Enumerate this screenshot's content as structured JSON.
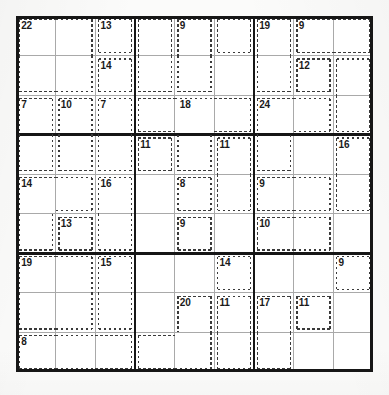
{
  "puzzle": {
    "type": "killer-sudoku",
    "grid_size": 9,
    "box_size": 3,
    "cell_px": 39.6,
    "grid_origin": {
      "x": 16,
      "y": 16
    },
    "colors": {
      "paper": "#fbfbfa",
      "grid_background": "#ffffff",
      "thick_line": "#161616",
      "thin_line": "#a9a9a9",
      "cage_dash": "#3a3a3a",
      "clue_text": "#1a1a1a"
    },
    "given_digits": [],
    "cages": [
      {
        "id": "cage-22",
        "sum": "22",
        "label_cell": [
          0,
          0
        ],
        "cells": [
          [
            0,
            0
          ],
          [
            0,
            1
          ],
          [
            1,
            0
          ],
          [
            1,
            1
          ]
        ]
      },
      {
        "id": "cage-13-top",
        "sum": "13",
        "label_cell": [
          0,
          2
        ],
        "cells": [
          [
            0,
            2
          ]
        ]
      },
      {
        "id": "cage-14-top",
        "sum": "14",
        "label_cell": [
          1,
          2
        ],
        "cells": [
          [
            1,
            2
          ]
        ]
      },
      {
        "id": "cage-9-c5",
        "sum": "9",
        "label_cell": [
          0,
          4
        ],
        "cells": [
          [
            0,
            4
          ],
          [
            1,
            4
          ]
        ]
      },
      {
        "id": "cage-9-r1c3-blank-left",
        "sum": "",
        "label_cell": [
          0,
          3
        ],
        "cells": [
          [
            0,
            3
          ],
          [
            1,
            3
          ]
        ]
      },
      {
        "id": "cage-topmid-right",
        "sum": "",
        "label_cell": [
          0,
          5
        ],
        "cells": [
          [
            0,
            5
          ]
        ]
      },
      {
        "id": "cage-19",
        "sum": "19",
        "label_cell": [
          0,
          6
        ],
        "cells": [
          [
            0,
            6
          ],
          [
            1,
            6
          ]
        ]
      },
      {
        "id": "cage-9-r1c8",
        "sum": "9",
        "label_cell": [
          0,
          7
        ],
        "cells": [
          [
            0,
            7
          ],
          [
            0,
            8
          ]
        ]
      },
      {
        "id": "cage-12",
        "sum": "12",
        "label_cell": [
          1,
          7
        ],
        "cells": [
          [
            1,
            7
          ]
        ]
      },
      {
        "id": "cage-r2c9",
        "sum": "",
        "label_cell": [
          1,
          8
        ],
        "cells": [
          [
            1,
            8
          ],
          [
            2,
            8
          ]
        ]
      },
      {
        "id": "cage-7-left",
        "sum": "7",
        "label_cell": [
          2,
          0
        ],
        "cells": [
          [
            2,
            0
          ],
          [
            3,
            0
          ]
        ]
      },
      {
        "id": "cage-10",
        "sum": "10",
        "label_cell": [
          2,
          1
        ],
        "cells": [
          [
            2,
            1
          ],
          [
            3,
            1
          ]
        ]
      },
      {
        "id": "cage-7-c3",
        "sum": "7",
        "label_cell": [
          2,
          2
        ],
        "cells": [
          [
            2,
            2
          ],
          [
            3,
            2
          ]
        ]
      },
      {
        "id": "cage-18",
        "sum": "18",
        "label_cell": [
          2,
          4
        ],
        "cells": [
          [
            2,
            3
          ],
          [
            2,
            4
          ],
          [
            2,
            5
          ],
          [
            3,
            4
          ]
        ]
      },
      {
        "id": "cage-24",
        "sum": "24",
        "label_cell": [
          2,
          6
        ],
        "cells": [
          [
            2,
            6
          ],
          [
            2,
            7
          ],
          [
            3,
            6
          ]
        ]
      },
      {
        "id": "cage-11-left",
        "sum": "11",
        "label_cell": [
          3,
          3
        ],
        "cells": [
          [
            3,
            3
          ]
        ]
      },
      {
        "id": "cage-11-right",
        "sum": "11",
        "label_cell": [
          3,
          5
        ],
        "cells": [
          [
            3,
            5
          ],
          [
            4,
            5
          ]
        ]
      },
      {
        "id": "cage-16-right",
        "sum": "16",
        "label_cell": [
          3,
          8
        ],
        "cells": [
          [
            3,
            8
          ],
          [
            4,
            8
          ]
        ]
      },
      {
        "id": "cage-14-mid",
        "sum": "14",
        "label_cell": [
          4,
          0
        ],
        "cells": [
          [
            4,
            0
          ],
          [
            4,
            1
          ],
          [
            5,
            0
          ]
        ]
      },
      {
        "id": "cage-16-mid",
        "sum": "16",
        "label_cell": [
          4,
          2
        ],
        "cells": [
          [
            4,
            2
          ],
          [
            5,
            2
          ]
        ]
      },
      {
        "id": "cage-13-mid",
        "sum": "13",
        "label_cell": [
          5,
          1
        ],
        "cells": [
          [
            5,
            1
          ]
        ]
      },
      {
        "id": "cage-8-mid",
        "sum": "8",
        "label_cell": [
          4,
          4
        ],
        "cells": [
          [
            4,
            4
          ]
        ]
      },
      {
        "id": "cage-9-mid",
        "sum": "9",
        "label_cell": [
          5,
          4
        ],
        "cells": [
          [
            5,
            4
          ]
        ]
      },
      {
        "id": "cage-9-r5c7",
        "sum": "9",
        "label_cell": [
          4,
          6
        ],
        "cells": [
          [
            4,
            6
          ],
          [
            4,
            7
          ]
        ]
      },
      {
        "id": "cage-10-r6c7",
        "sum": "10",
        "label_cell": [
          5,
          6
        ],
        "cells": [
          [
            5,
            6
          ],
          [
            5,
            7
          ]
        ]
      },
      {
        "id": "cage-19-bot",
        "sum": "19",
        "label_cell": [
          6,
          0
        ],
        "cells": [
          [
            6,
            0
          ],
          [
            6,
            1
          ],
          [
            7,
            0
          ],
          [
            7,
            1
          ]
        ]
      },
      {
        "id": "cage-15-bot",
        "sum": "15",
        "label_cell": [
          6,
          2
        ],
        "cells": [
          [
            6,
            2
          ],
          [
            7,
            2
          ]
        ]
      },
      {
        "id": "cage-8-bot",
        "sum": "8",
        "label_cell": [
          8,
          0
        ],
        "cells": [
          [
            8,
            0
          ],
          [
            8,
            1
          ],
          [
            8,
            2
          ]
        ]
      },
      {
        "id": "cage-14-bot",
        "sum": "14",
        "label_cell": [
          6,
          5
        ],
        "cells": [
          [
            6,
            5
          ]
        ]
      },
      {
        "id": "cage-20",
        "sum": "20",
        "label_cell": [
          7,
          4
        ],
        "cells": [
          [
            7,
            4
          ],
          [
            8,
            4
          ],
          [
            8,
            3
          ]
        ]
      },
      {
        "id": "cage-11-bot",
        "sum": "11",
        "label_cell": [
          7,
          5
        ],
        "cells": [
          [
            7,
            5
          ],
          [
            8,
            5
          ]
        ]
      },
      {
        "id": "cage-9-bot-right",
        "sum": "9",
        "label_cell": [
          6,
          8
        ],
        "cells": [
          [
            6,
            8
          ]
        ]
      },
      {
        "id": "cage-17-bot",
        "sum": "17",
        "label_cell": [
          7,
          6
        ],
        "cells": [
          [
            7,
            6
          ],
          [
            8,
            6
          ]
        ]
      },
      {
        "id": "cage-11-bot-c8",
        "sum": "11",
        "label_cell": [
          7,
          7
        ],
        "cells": [
          [
            7,
            7
          ]
        ]
      }
    ],
    "clue_labels": [
      {
        "text": "22",
        "row": 0,
        "col": 0
      },
      {
        "text": "13",
        "row": 0,
        "col": 2
      },
      {
        "text": "9",
        "row": 0,
        "col": 4
      },
      {
        "text": "19",
        "row": 0,
        "col": 6
      },
      {
        "text": "9",
        "row": 0,
        "col": 7
      },
      {
        "text": "14",
        "row": 1,
        "col": 2
      },
      {
        "text": "12",
        "row": 1,
        "col": 7
      },
      {
        "text": "7",
        "row": 2,
        "col": 0
      },
      {
        "text": "10",
        "row": 2,
        "col": 1
      },
      {
        "text": "7",
        "row": 2,
        "col": 2
      },
      {
        "text": "18",
        "row": 2,
        "col": 4
      },
      {
        "text": "24",
        "row": 2,
        "col": 6
      },
      {
        "text": "11",
        "row": 3,
        "col": 3
      },
      {
        "text": "11",
        "row": 3,
        "col": 5
      },
      {
        "text": "16",
        "row": 3,
        "col": 8
      },
      {
        "text": "14",
        "row": 4,
        "col": 0
      },
      {
        "text": "16",
        "row": 4,
        "col": 2
      },
      {
        "text": "8",
        "row": 4,
        "col": 4
      },
      {
        "text": "9",
        "row": 4,
        "col": 6
      },
      {
        "text": "13",
        "row": 5,
        "col": 1
      },
      {
        "text": "9",
        "row": 5,
        "col": 4
      },
      {
        "text": "10",
        "row": 5,
        "col": 6
      },
      {
        "text": "19",
        "row": 6,
        "col": 0
      },
      {
        "text": "15",
        "row": 6,
        "col": 2
      },
      {
        "text": "14",
        "row": 6,
        "col": 5
      },
      {
        "text": "9",
        "row": 6,
        "col": 8
      },
      {
        "text": "20",
        "row": 7,
        "col": 4
      },
      {
        "text": "11",
        "row": 7,
        "col": 5
      },
      {
        "text": "17",
        "row": 7,
        "col": 6
      },
      {
        "text": "11",
        "row": 7,
        "col": 7
      },
      {
        "text": "8",
        "row": 8,
        "col": 0
      }
    ],
    "cage_outline_segments": [
      {
        "x1": 0.12,
        "y1": 0.12,
        "x2": 2.88,
        "y2": 0.12
      },
      {
        "x1": 0.12,
        "y1": 0.12,
        "x2": 0.12,
        "y2": 2.88
      },
      {
        "x1": 0.12,
        "y1": 1.88,
        "x2": 2.0,
        "y2": 1.88
      },
      {
        "x1": 2.0,
        "y1": 0.12,
        "x2": 2.0,
        "y2": 1.88
      }
    ]
  }
}
